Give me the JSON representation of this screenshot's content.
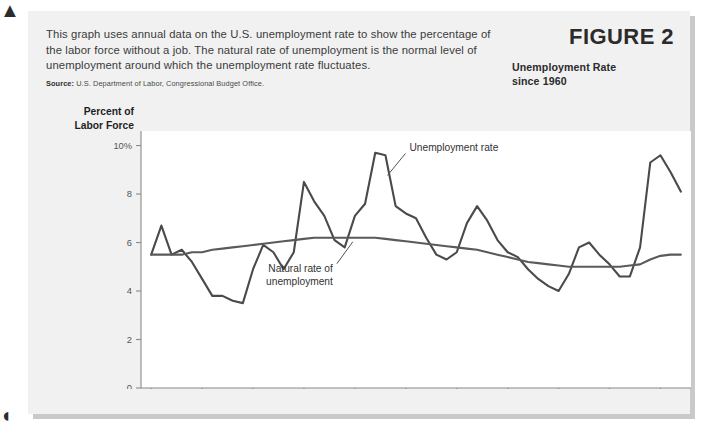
{
  "figure": {
    "number_label": "FIGURE 2",
    "subtitle_line1": "Unemployment Rate",
    "subtitle_line2": "since 1960",
    "caption": "This graph uses annual data on the U.S. unemployment rate to show the percentage of the labor force without a job. The natural rate of unemployment is the normal level of unemployment around which the unemployment rate fluctuates.",
    "source_label": "Source:",
    "source_text": "U.S. Department of Labor, Congressional Budget Office.",
    "corner_mark_top": "▲",
    "corner_mark_bottom": "◖"
  },
  "axis_title": {
    "line1": "Percent of",
    "line2": "Labor Force"
  },
  "colors": {
    "page_background": "#ffffff",
    "panel_background": "#f1f1f1",
    "panel_shadow": "#c9c9c9",
    "plot_background": "#ffffff",
    "unemployment_line": "#4a4a4a",
    "natural_rate_line": "#5a5a5a",
    "axis": "#8a8a8a",
    "tick_text": "#555555",
    "caption_text": "#3b3b3b"
  },
  "chart_data": {
    "type": "line",
    "title": "Unemployment Rate since 1960",
    "xlabel": "",
    "ylabel": "Percent of Labor Force",
    "xlim": [
      1959,
      2013
    ],
    "ylim": [
      0,
      10.6
    ],
    "grid": false,
    "legend": "inline-annotations",
    "ytick_labels": [
      "0",
      "2",
      "4",
      "6",
      "8",
      "10%"
    ],
    "ytick_values": [
      0,
      2,
      4,
      6,
      8,
      10
    ],
    "xtick_labels": [
      "1960",
      "1965",
      "1970",
      "1975",
      "1980",
      "1985",
      "1990",
      "1995",
      "2000",
      "2005",
      "2010"
    ],
    "xtick_values": [
      1960,
      1965,
      1970,
      1975,
      1980,
      1985,
      1990,
      1995,
      2000,
      2005,
      2010
    ],
    "annotations": [
      {
        "text": "Unemployment rate",
        "target_year": 1983,
        "target_value": 8.6
      },
      {
        "text": "Natural rate of",
        "target_year": 1980,
        "target_value": 6.2
      },
      {
        "text": "unemployment",
        "target_year": 1980,
        "target_value": 6.2
      }
    ],
    "x": [
      1960,
      1961,
      1962,
      1963,
      1964,
      1965,
      1966,
      1967,
      1968,
      1969,
      1970,
      1971,
      1972,
      1973,
      1974,
      1975,
      1976,
      1977,
      1978,
      1979,
      1980,
      1981,
      1982,
      1983,
      1984,
      1985,
      1986,
      1987,
      1988,
      1989,
      1990,
      1991,
      1992,
      1993,
      1994,
      1995,
      1996,
      1997,
      1998,
      1999,
      2000,
      2001,
      2002,
      2003,
      2004,
      2005,
      2006,
      2007,
      2008,
      2009,
      2010,
      2011,
      2012
    ],
    "series": [
      {
        "name": "Unemployment rate",
        "color": "#4a4a4a",
        "values": [
          5.5,
          6.7,
          5.5,
          5.7,
          5.2,
          4.5,
          3.8,
          3.8,
          3.6,
          3.5,
          4.9,
          5.9,
          5.6,
          4.9,
          5.6,
          8.5,
          7.7,
          7.1,
          6.1,
          5.8,
          7.1,
          7.6,
          9.7,
          9.6,
          7.5,
          7.2,
          7.0,
          6.2,
          5.5,
          5.3,
          5.6,
          6.8,
          7.5,
          6.9,
          6.1,
          5.6,
          5.4,
          4.9,
          4.5,
          4.2,
          4.0,
          4.7,
          5.8,
          6.0,
          5.5,
          5.1,
          4.6,
          4.6,
          5.8,
          9.3,
          9.6,
          8.9,
          8.1
        ]
      },
      {
        "name": "Natural rate of unemployment",
        "color": "#5a5a5a",
        "values": [
          5.5,
          5.5,
          5.5,
          5.5,
          5.6,
          5.6,
          5.7,
          5.75,
          5.8,
          5.85,
          5.9,
          5.95,
          6.0,
          6.05,
          6.1,
          6.15,
          6.2,
          6.2,
          6.2,
          6.2,
          6.2,
          6.2,
          6.2,
          6.15,
          6.1,
          6.05,
          6.0,
          5.95,
          5.9,
          5.85,
          5.8,
          5.75,
          5.7,
          5.6,
          5.5,
          5.4,
          5.3,
          5.2,
          5.15,
          5.1,
          5.05,
          5.0,
          5.0,
          5.0,
          5.0,
          5.0,
          5.0,
          5.05,
          5.1,
          5.3,
          5.45,
          5.5,
          5.5
        ]
      }
    ]
  }
}
